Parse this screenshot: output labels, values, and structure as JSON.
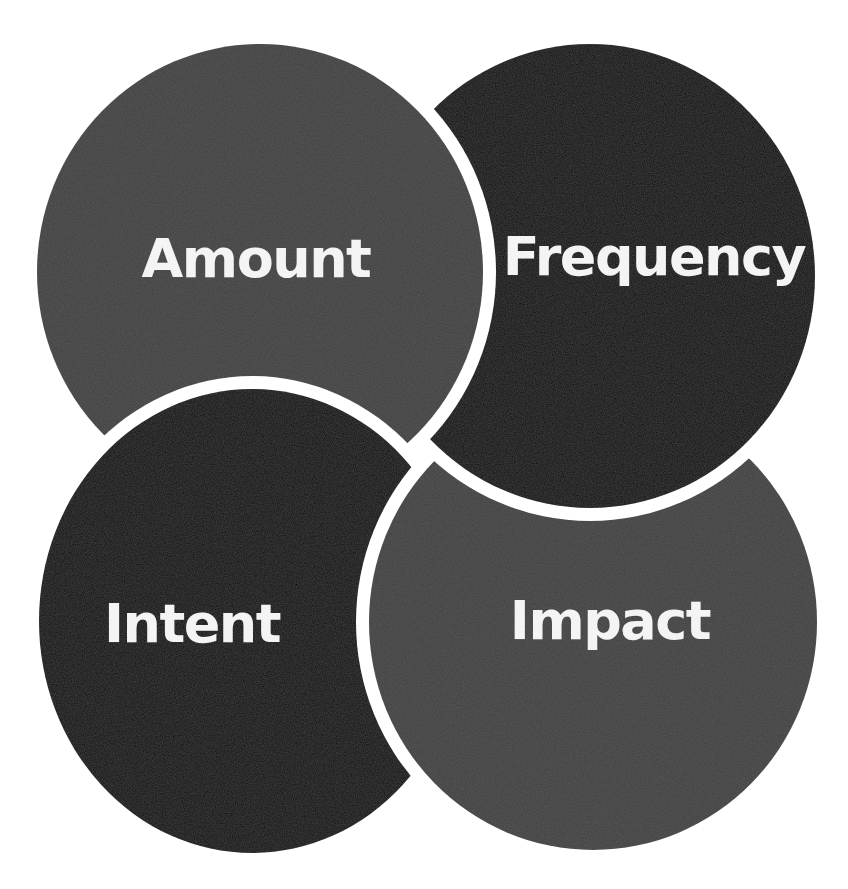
{
  "diagram": {
    "type": "four-circle-interlocking",
    "background": "#ffffff",
    "gap_color": "#ffffff",
    "gap_width": 13,
    "circles": [
      {
        "id": "amount",
        "label": "Amount",
        "fill": "#404040",
        "cx": 260,
        "cy": 272,
        "rx": 223,
        "ry": 228,
        "label_x": 256,
        "label_y": 259,
        "covered_by": "intent"
      },
      {
        "id": "frequency",
        "label": "Frequency",
        "fill": "#0b0b0b",
        "cx": 590,
        "cy": 276,
        "rx": 225,
        "ry": 232,
        "label_x": 654,
        "label_y": 257,
        "covered_by": "amount"
      },
      {
        "id": "intent",
        "label": "Intent",
        "fill": "#0b0b0b",
        "cx": 252,
        "cy": 621,
        "rx": 213,
        "ry": 232,
        "label_x": 192,
        "label_y": 624,
        "covered_by": "impact"
      },
      {
        "id": "impact",
        "label": "Impact",
        "fill": "#404040",
        "cx": 593,
        "cy": 622,
        "rx": 224,
        "ry": 228,
        "label_x": 610,
        "label_y": 621,
        "covered_by": "frequency"
      }
    ]
  }
}
